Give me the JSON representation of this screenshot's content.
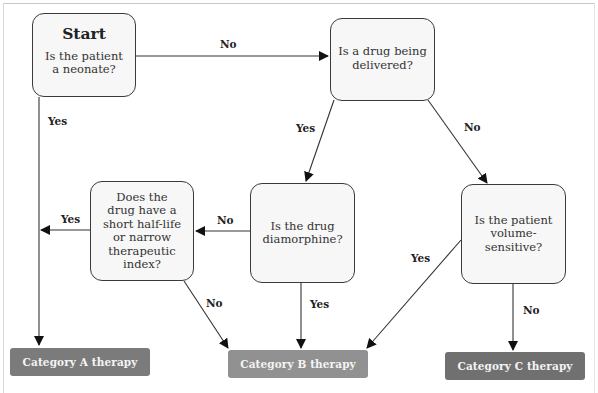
{
  "diagram": {
    "type": "flowchart",
    "nodes": {
      "start": {
        "title": "Start",
        "text": "Is the patient a neonate?"
      },
      "drug_delivered": {
        "text": "Is a drug being delivered?"
      },
      "short_half_life": {
        "text": "Does the drug have a short half-life or narrow therapeutic index?"
      },
      "diamorphine": {
        "text": "Is the drug diamorphine?"
      },
      "volume_sensitive": {
        "text": "Is the patient volume-sensitive?"
      }
    },
    "outcomes": {
      "category_a": {
        "label": "Category A therapy",
        "color": "#7b7b7b"
      },
      "category_b": {
        "label": "Category B therapy",
        "color": "#919191"
      },
      "category_c": {
        "label": "Category C therapy",
        "color": "#707070"
      }
    },
    "edges": {
      "start_no": {
        "from": "start",
        "to": "drug_delivered",
        "label": "No"
      },
      "start_yes": {
        "from": "start",
        "to": "category_a",
        "label": "Yes"
      },
      "delivered_yes": {
        "from": "drug_delivered",
        "to": "diamorphine",
        "label": "Yes"
      },
      "delivered_no": {
        "from": "drug_delivered",
        "to": "volume_sensitive",
        "label": "No"
      },
      "diamorphine_no": {
        "from": "diamorphine",
        "to": "short_half_life",
        "label": "No"
      },
      "diamorphine_yes": {
        "from": "diamorphine",
        "to": "category_b",
        "label": "Yes"
      },
      "half_life_yes": {
        "from": "short_half_life",
        "to": "category_a",
        "label": "Yes"
      },
      "half_life_no": {
        "from": "short_half_life",
        "to": "category_b",
        "label": "No"
      },
      "volume_yes": {
        "from": "volume_sensitive",
        "to": "category_b",
        "label": "Yes"
      },
      "volume_no": {
        "from": "volume_sensitive",
        "to": "category_c",
        "label": "No"
      }
    }
  }
}
